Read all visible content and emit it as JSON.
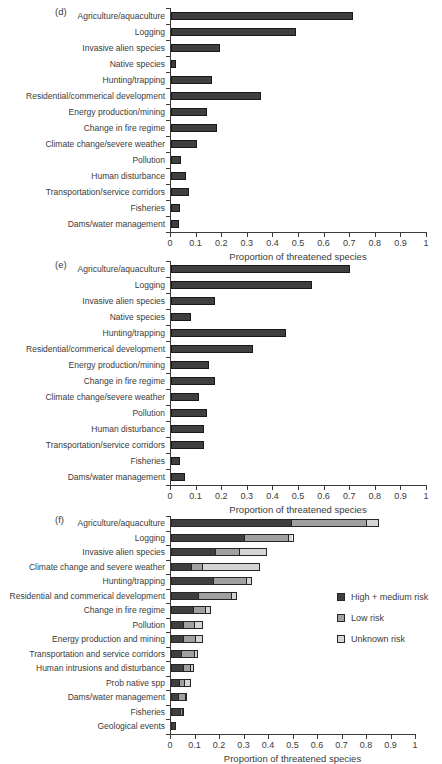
{
  "page": {
    "background": "#ffffff",
    "xaxis_title": "Proportion of threatened species"
  },
  "colors": {
    "high_medium_risk": "#3f3f3f",
    "low_risk": "#a0a0a0",
    "unknown_risk": "#d4d4d4",
    "axis": "#3a3a3a",
    "text": "#3b3b3b"
  },
  "chart_data": [
    {
      "type": "bar",
      "panel_letter": "(d)",
      "orientation": "horizontal",
      "title": "",
      "xlabel": "Proportion of threatened species",
      "ylabel": "",
      "xlim": [
        0,
        1
      ],
      "grid": false,
      "xtick_labels": [
        "0",
        "0.1",
        "0.2",
        "0.3",
        "0.4",
        "0.5",
        "0.6",
        "0.7",
        "0.8",
        "0.9",
        "1"
      ],
      "xticks": [
        0,
        0.1,
        0.2,
        0.3,
        0.4,
        0.5,
        0.6,
        0.7,
        0.8,
        0.9,
        1
      ],
      "categories": [
        "Agriculture/aquaculture",
        "Logging",
        "Invasive alien species",
        "Native species",
        "Hunting/trapping",
        "Residential/commerical development",
        "Energy production/mining",
        "Change in fire regime",
        "Climate change/severe weather",
        "Pollution",
        "Human disturbance",
        "Transportation/service corridors",
        "Fisheries",
        "Dams/water management"
      ],
      "values": [
        0.71,
        0.49,
        0.19,
        0.02,
        0.16,
        0.35,
        0.14,
        0.18,
        0.1,
        0.04,
        0.06,
        0.07,
        0.035,
        0.03
      ]
    },
    {
      "type": "bar",
      "panel_letter": "(e)",
      "orientation": "horizontal",
      "title": "",
      "xlabel": "Proportion of threatened species",
      "ylabel": "",
      "xlim": [
        0,
        1
      ],
      "grid": false,
      "xtick_labels": [
        "0",
        "0.1",
        "0.2",
        "0.3",
        "0.4",
        "0.5",
        "0.6",
        "0.7",
        "0.8",
        "0.9",
        "1"
      ],
      "xticks": [
        0,
        0.1,
        0.2,
        0.3,
        0.4,
        0.5,
        0.6,
        0.7,
        0.8,
        0.9,
        1
      ],
      "categories": [
        "Agriculture/aquaculture",
        "Logging",
        "Invasive alien species",
        "Native species",
        "Hunting/trapping",
        "Residential/commerical development",
        "Energy production/mining",
        "Change in fire regime",
        "Climate change/severe weather",
        "Pollution",
        "Human disturbance",
        "Transportation/service corridors",
        "Fisheries",
        "Dams/water management"
      ],
      "values": [
        0.7,
        0.55,
        0.17,
        0.08,
        0.45,
        0.32,
        0.15,
        0.17,
        0.11,
        0.14,
        0.13,
        0.13,
        0.035,
        0.055
      ]
    },
    {
      "type": "stacked-bar",
      "panel_letter": "(f)",
      "orientation": "horizontal",
      "title": "",
      "xlabel": "Proportion of threatened species",
      "ylabel": "",
      "xlim": [
        0,
        1
      ],
      "grid": false,
      "legend_position": "right-middle",
      "xtick_labels": [
        "0",
        "0.1",
        "0.2",
        "0.3",
        "0.4",
        "0.5",
        "0.6",
        "0.7",
        "0.8",
        "0.9",
        "1"
      ],
      "xticks": [
        0,
        0.1,
        0.2,
        0.3,
        0.4,
        0.5,
        0.6,
        0.7,
        0.8,
        0.9,
        1
      ],
      "categories": [
        "Agriculture/aquaculture",
        "Logging",
        "Invasive alien species",
        "Climate change and severe weather",
        "Hunting/trapping",
        "Residential and commerical development",
        "Change in fire regime",
        "Pollution",
        "Energy production and mining",
        "Transportation and service corridors",
        "Human intrusions and disturbance",
        "Prob native spp",
        "Dams/water management",
        "Fisheries",
        "Geological events"
      ],
      "series": [
        {
          "name": "High + medium risk",
          "color_key": "high_medium_risk",
          "values": [
            0.49,
            0.3,
            0.18,
            0.08,
            0.17,
            0.11,
            0.09,
            0.05,
            0.05,
            0.04,
            0.05,
            0.03,
            0.03,
            0.04,
            0.02
          ]
        },
        {
          "name": "Low risk",
          "color_key": "low_risk",
          "values": [
            0.31,
            0.18,
            0.1,
            0.045,
            0.14,
            0.14,
            0.05,
            0.045,
            0.05,
            0.055,
            0.03,
            0.025,
            0.03,
            0.01,
            0
          ]
        },
        {
          "name": "Unknown risk",
          "color_key": "unknown_risk",
          "values": [
            0.05,
            0.02,
            0.11,
            0.24,
            0.02,
            0.02,
            0.025,
            0.035,
            0.03,
            0.015,
            0.015,
            0.025,
            0.005,
            0.005,
            0
          ]
        }
      ]
    }
  ]
}
